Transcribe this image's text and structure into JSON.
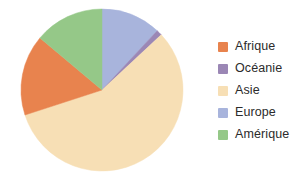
{
  "chart_data": {
    "type": "pie",
    "title": "",
    "categories": [
      "Afrique",
      "Océanie",
      "Asie",
      "Europe",
      "Amérique"
    ],
    "values": [
      16,
      1,
      57,
      12,
      14
    ],
    "unit": "percent",
    "legend_position": "right",
    "grid": false,
    "colors": {
      "Afrique": "#E8834E",
      "Océanie": "#9B87B5",
      "Asie": "#F7DFB5",
      "Europe": "#A8B4DC",
      "Amérique": "#95C888"
    },
    "slice_order_clockwise_from_top": [
      "Europe",
      "Océanie",
      "Asie",
      "Afrique",
      "Amérique"
    ],
    "slices": [
      {
        "label": "Europe",
        "value": 12,
        "color": "#A8B4DC",
        "start_angle": 0,
        "end_angle": 43
      },
      {
        "label": "Océanie",
        "value": 1,
        "color": "#9B87B5",
        "start_angle": 43,
        "end_angle": 47
      },
      {
        "label": "Asie",
        "value": 57,
        "color": "#F7DFB5",
        "start_angle": 47,
        "end_angle": 252
      },
      {
        "label": "Afrique",
        "value": 16,
        "color": "#E8834E",
        "start_angle": 252,
        "end_angle": 310
      },
      {
        "label": "Amérique",
        "value": 14,
        "color": "#95C888",
        "start_angle": 310,
        "end_angle": 360
      }
    ]
  },
  "legend": {
    "items": [
      {
        "label": "Afrique",
        "color": "#E8834E",
        "icon": "legend-swatch-icon"
      },
      {
        "label": "Océanie",
        "color": "#9B87B5",
        "icon": "legend-swatch-icon"
      },
      {
        "label": "Asie",
        "color": "#F7DFB5",
        "icon": "legend-swatch-icon"
      },
      {
        "label": "Europe",
        "color": "#A8B4DC",
        "icon": "legend-swatch-icon"
      },
      {
        "label": "Amérique",
        "color": "#95C888",
        "icon": "legend-swatch-icon"
      }
    ]
  },
  "pie_geometry": {
    "cx": 102,
    "cy": 90,
    "r": 81
  }
}
